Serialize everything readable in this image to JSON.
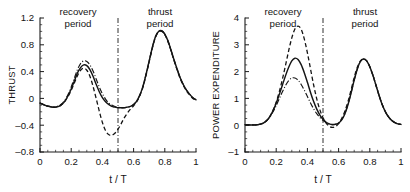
{
  "figure": {
    "panels": [
      {
        "id": "thrust-panel",
        "ylabel": "THRUST",
        "xlabel": "t / T",
        "region_recovery_line1": "recovery",
        "region_recovery_line2": "period",
        "region_thrust_line1": "thrust",
        "region_thrust_line2": "period",
        "xticks": [
          "0",
          "0.2",
          "0.4",
          "0.6",
          "0.8",
          "1"
        ],
        "yticks": [
          "1.2",
          "0.8",
          "0.4",
          "0",
          "-0.4",
          "-0.8"
        ]
      },
      {
        "id": "power-panel",
        "ylabel": "POWER EXPENDITURE",
        "xlabel": "t / T",
        "region_recovery_line1": "recovery",
        "region_recovery_line2": "period",
        "region_thrust_line1": "thrust",
        "region_thrust_line2": "period",
        "xticks": [
          "0",
          "0.2",
          "0.4",
          "0.6",
          "0.8",
          "1"
        ],
        "yticks": [
          "4",
          "3",
          "2",
          "1",
          "0",
          "-1"
        ]
      }
    ]
  },
  "chart_data": [
    {
      "type": "line",
      "title": "",
      "xlabel": "t / T",
      "ylabel": "THRUST",
      "xlim": [
        0,
        1
      ],
      "ylim": [
        -0.8,
        1.2
      ],
      "xticks": [
        0,
        0.2,
        0.4,
        0.6,
        0.8,
        1
      ],
      "yticks": [
        -0.8,
        -0.4,
        0,
        0.4,
        0.8,
        1.2
      ],
      "grid": false,
      "legend": "none",
      "annotations": [
        {
          "text": "recovery period",
          "x": 0.25,
          "y": 1.15
        },
        {
          "text": "thrust period",
          "x": 0.76,
          "y": 1.15
        },
        {
          "text": "divider",
          "type": "vline",
          "x": 0.5,
          "style": "dash-dot"
        }
      ],
      "x": [
        0,
        0.02,
        0.04,
        0.06,
        0.08,
        0.1,
        0.12,
        0.14,
        0.16,
        0.18,
        0.2,
        0.22,
        0.24,
        0.26,
        0.28,
        0.3,
        0.32,
        0.34,
        0.36,
        0.38,
        0.4,
        0.42,
        0.44,
        0.46,
        0.48,
        0.5,
        0.52,
        0.54,
        0.56,
        0.58,
        0.6,
        0.62,
        0.64,
        0.66,
        0.68,
        0.7,
        0.72,
        0.74,
        0.76,
        0.78,
        0.8,
        0.82,
        0.84,
        0.86,
        0.88,
        0.9,
        0.92,
        0.94,
        0.96,
        0.98,
        1
      ],
      "series": [
        {
          "name": "solid",
          "style": "solid",
          "values": [
            -0.07,
            -0.09,
            -0.11,
            -0.12,
            -0.13,
            -0.13,
            -0.12,
            -0.09,
            -0.04,
            0.04,
            0.14,
            0.26,
            0.38,
            0.46,
            0.5,
            0.49,
            0.43,
            0.33,
            0.21,
            0.1,
            0.01,
            -0.05,
            -0.09,
            -0.12,
            -0.13,
            -0.14,
            -0.14,
            -0.14,
            -0.13,
            -0.12,
            -0.09,
            -0.04,
            0.05,
            0.18,
            0.36,
            0.56,
            0.76,
            0.92,
            1.0,
            1.01,
            0.96,
            0.86,
            0.72,
            0.57,
            0.43,
            0.3,
            0.2,
            0.12,
            0.06,
            0.01,
            -0.02
          ]
        },
        {
          "name": "dashed",
          "style": "dashed",
          "values": [
            -0.07,
            -0.09,
            -0.11,
            -0.12,
            -0.13,
            -0.13,
            -0.12,
            -0.09,
            -0.04,
            0.03,
            0.12,
            0.23,
            0.34,
            0.42,
            0.45,
            0.42,
            0.33,
            0.18,
            0.0,
            -0.19,
            -0.36,
            -0.48,
            -0.54,
            -0.55,
            -0.52,
            -0.46,
            -0.38,
            -0.29,
            -0.22,
            -0.16,
            -0.11,
            -0.05,
            0.04,
            0.17,
            0.35,
            0.55,
            0.75,
            0.91,
            0.99,
            1.0,
            0.95,
            0.85,
            0.71,
            0.56,
            0.42,
            0.29,
            0.19,
            0.11,
            0.05,
            0.0,
            -0.03
          ]
        },
        {
          "name": "dash-dot",
          "style": "dash-dot",
          "values": [
            -0.07,
            -0.09,
            -0.11,
            -0.12,
            -0.13,
            -0.13,
            -0.11,
            -0.08,
            -0.02,
            0.06,
            0.17,
            0.3,
            0.43,
            0.52,
            0.56,
            0.55,
            0.5,
            0.41,
            0.29,
            0.17,
            0.07,
            -0.01,
            -0.07,
            -0.1,
            -0.12,
            -0.13,
            -0.14,
            -0.14,
            -0.13,
            -0.12,
            -0.09,
            -0.04,
            0.05,
            0.18,
            0.36,
            0.56,
            0.76,
            0.92,
            1.0,
            1.01,
            0.96,
            0.86,
            0.72,
            0.57,
            0.43,
            0.3,
            0.2,
            0.12,
            0.06,
            0.01,
            -0.02
          ]
        }
      ]
    },
    {
      "type": "line",
      "title": "",
      "xlabel": "t / T",
      "ylabel": "POWER EXPENDITURE",
      "xlim": [
        0,
        1
      ],
      "ylim": [
        -1,
        4
      ],
      "xticks": [
        0,
        0.2,
        0.4,
        0.6,
        0.8,
        1
      ],
      "yticks": [
        -1,
        0,
        1,
        2,
        3,
        4
      ],
      "grid": false,
      "legend": "none",
      "annotations": [
        {
          "text": "recovery period",
          "x": 0.25,
          "y": 3.8
        },
        {
          "text": "thrust period",
          "x": 0.76,
          "y": 3.8
        },
        {
          "text": "divider",
          "type": "vline",
          "x": 0.5,
          "style": "dash-dot"
        }
      ],
      "x": [
        0,
        0.02,
        0.04,
        0.06,
        0.08,
        0.1,
        0.12,
        0.14,
        0.16,
        0.18,
        0.2,
        0.22,
        0.24,
        0.26,
        0.28,
        0.3,
        0.32,
        0.34,
        0.36,
        0.38,
        0.4,
        0.42,
        0.44,
        0.46,
        0.48,
        0.5,
        0.52,
        0.54,
        0.56,
        0.58,
        0.6,
        0.62,
        0.64,
        0.66,
        0.68,
        0.7,
        0.72,
        0.74,
        0.76,
        0.78,
        0.8,
        0.82,
        0.84,
        0.86,
        0.88,
        0.9,
        0.92,
        0.94,
        0.96,
        0.98,
        1
      ],
      "series": [
        {
          "name": "solid",
          "style": "solid",
          "values": [
            0.02,
            0.01,
            0.01,
            0.01,
            0.02,
            0.04,
            0.09,
            0.18,
            0.33,
            0.55,
            0.82,
            1.15,
            1.5,
            1.85,
            2.16,
            2.4,
            2.5,
            2.45,
            2.26,
            1.96,
            1.6,
            1.22,
            0.88,
            0.6,
            0.38,
            0.22,
            0.11,
            0.05,
            0.02,
            0.03,
            0.08,
            0.2,
            0.42,
            0.76,
            1.2,
            1.68,
            2.1,
            2.38,
            2.47,
            2.4,
            2.18,
            1.86,
            1.48,
            1.1,
            0.76,
            0.5,
            0.31,
            0.18,
            0.1,
            0.05,
            0.03
          ]
        },
        {
          "name": "dashed",
          "style": "dashed",
          "values": [
            0.02,
            0.01,
            0.01,
            0.01,
            0.02,
            0.04,
            0.09,
            0.18,
            0.33,
            0.56,
            0.86,
            1.25,
            1.72,
            2.24,
            2.78,
            3.26,
            3.59,
            3.7,
            3.58,
            3.22,
            2.7,
            2.1,
            1.5,
            0.98,
            0.57,
            0.28,
            0.08,
            -0.04,
            -0.08,
            -0.05,
            0.06,
            0.25,
            0.52,
            0.88,
            1.32,
            1.78,
            2.16,
            2.4,
            2.47,
            2.4,
            2.18,
            1.86,
            1.48,
            1.1,
            0.76,
            0.5,
            0.31,
            0.18,
            0.1,
            0.05,
            0.03
          ]
        },
        {
          "name": "dash-dot",
          "style": "dash-dot",
          "values": [
            0.02,
            0.01,
            0.01,
            0.01,
            0.02,
            0.04,
            0.09,
            0.17,
            0.31,
            0.5,
            0.73,
            0.99,
            1.25,
            1.48,
            1.66,
            1.76,
            1.76,
            1.68,
            1.52,
            1.31,
            1.07,
            0.83,
            0.61,
            0.43,
            0.29,
            0.18,
            0.1,
            0.05,
            0.03,
            0.04,
            0.09,
            0.21,
            0.43,
            0.77,
            1.21,
            1.68,
            2.1,
            2.38,
            2.47,
            2.4,
            2.18,
            1.86,
            1.48,
            1.1,
            0.76,
            0.5,
            0.31,
            0.18,
            0.1,
            0.05,
            0.03
          ]
        }
      ]
    }
  ]
}
